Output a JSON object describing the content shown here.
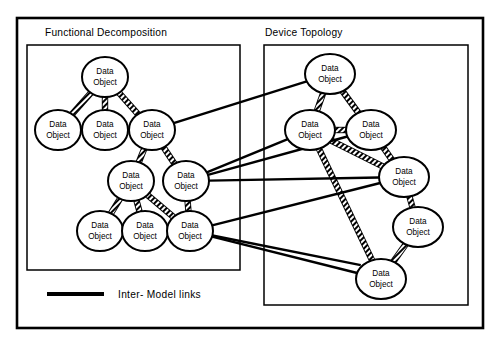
{
  "figure": {
    "node_label_line1": "Data",
    "node_label_line2": "Object"
  },
  "panels": [
    {
      "id": "functional-decomposition",
      "title": "Functional Decomposition",
      "title_x": 45,
      "title_y": 36,
      "box": {
        "x": 27,
        "y": 45,
        "w": 213,
        "h": 225
      }
    },
    {
      "id": "device-topology",
      "title": "Device Topology",
      "title_x": 265,
      "title_y": 36,
      "box": {
        "x": 264,
        "y": 45,
        "w": 204,
        "h": 260
      }
    }
  ],
  "frame": {
    "x": 17,
    "y": 18,
    "w": 466,
    "h": 310
  },
  "legend": {
    "label": "Inter- Model links",
    "line": {
      "x1": 47,
      "y1": 294,
      "x2": 104,
      "y2": 294
    },
    "text_x": 118,
    "text_y": 298
  },
  "nodes": [
    {
      "id": "fd-1",
      "panel": "functional-decomposition",
      "cx": 105,
      "cy": 77,
      "rx": 23,
      "ry": 20
    },
    {
      "id": "fd-2",
      "panel": "functional-decomposition",
      "cx": 58,
      "cy": 130,
      "rx": 23,
      "ry": 20
    },
    {
      "id": "fd-3",
      "panel": "functional-decomposition",
      "cx": 105,
      "cy": 130,
      "rx": 23,
      "ry": 20
    },
    {
      "id": "fd-4",
      "panel": "functional-decomposition",
      "cx": 152,
      "cy": 130,
      "rx": 23,
      "ry": 20
    },
    {
      "id": "fd-5",
      "panel": "functional-decomposition",
      "cx": 131,
      "cy": 181,
      "rx": 23,
      "ry": 20
    },
    {
      "id": "fd-6",
      "panel": "functional-decomposition",
      "cx": 186,
      "cy": 181,
      "rx": 23,
      "ry": 20
    },
    {
      "id": "fd-7",
      "panel": "functional-decomposition",
      "cx": 100,
      "cy": 231,
      "rx": 23,
      "ry": 20
    },
    {
      "id": "fd-8",
      "panel": "functional-decomposition",
      "cx": 145,
      "cy": 231,
      "rx": 23,
      "ry": 20
    },
    {
      "id": "fd-9",
      "panel": "functional-decomposition",
      "cx": 190,
      "cy": 231,
      "rx": 23,
      "ry": 20
    },
    {
      "id": "dt-1",
      "panel": "device-topology",
      "cx": 330,
      "cy": 74,
      "rx": 25,
      "ry": 20
    },
    {
      "id": "dt-2",
      "panel": "device-topology",
      "cx": 310,
      "cy": 130,
      "rx": 25,
      "ry": 20
    },
    {
      "id": "dt-3",
      "panel": "device-topology",
      "cx": 371,
      "cy": 130,
      "rx": 25,
      "ry": 20
    },
    {
      "id": "dt-4",
      "panel": "device-topology",
      "cx": 404,
      "cy": 177,
      "rx": 25,
      "ry": 20
    },
    {
      "id": "dt-5",
      "panel": "device-topology",
      "cx": 418,
      "cy": 227,
      "rx": 25,
      "ry": 20
    },
    {
      "id": "dt-6",
      "panel": "device-topology",
      "cx": 381,
      "cy": 279,
      "rx": 25,
      "ry": 20
    }
  ],
  "intra_links": [
    {
      "from": "fd-1",
      "to": "fd-2"
    },
    {
      "from": "fd-1",
      "to": "fd-3"
    },
    {
      "from": "fd-1",
      "to": "fd-4"
    },
    {
      "from": "fd-4",
      "to": "fd-5"
    },
    {
      "from": "fd-4",
      "to": "fd-6"
    },
    {
      "from": "fd-5",
      "to": "fd-7"
    },
    {
      "from": "fd-5",
      "to": "fd-8"
    },
    {
      "from": "fd-5",
      "to": "fd-9"
    },
    {
      "from": "fd-6",
      "to": "fd-9"
    },
    {
      "from": "dt-1",
      "to": "dt-2"
    },
    {
      "from": "dt-1",
      "to": "dt-3"
    },
    {
      "from": "dt-2",
      "to": "dt-3"
    },
    {
      "from": "dt-2",
      "to": "dt-4"
    },
    {
      "from": "dt-2",
      "to": "dt-6"
    },
    {
      "from": "dt-3",
      "to": "dt-4"
    },
    {
      "from": "dt-4",
      "to": "dt-5"
    },
    {
      "from": "dt-5",
      "to": "dt-6"
    }
  ],
  "inter_links": [
    {
      "from": "fd-4",
      "to": "dt-1"
    },
    {
      "from": "fd-6",
      "to": "dt-2"
    },
    {
      "from": "fd-6",
      "to": "dt-3"
    },
    {
      "from": "fd-6",
      "to": "dt-4"
    },
    {
      "from": "fd-9",
      "to": "dt-4"
    },
    {
      "from": "fd-9",
      "to": "dt-6"
    },
    {
      "from": "fd-9",
      "to": "dt-6b"
    }
  ],
  "colors": {
    "ink": "#000000",
    "paper": "#ffffff"
  }
}
